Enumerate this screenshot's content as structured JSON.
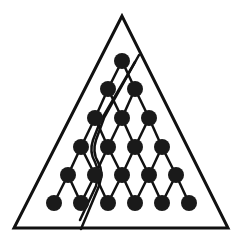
{
  "diagram": {
    "type": "triangular-lattice-partition",
    "colors": {
      "stroke": "#111111",
      "node": "#1a1a1a",
      "background": "#ffffff"
    },
    "outer_triangle": {
      "apex": [
        122,
        16
      ],
      "left": [
        14,
        228
      ],
      "right": [
        228,
        228
      ],
      "stroke_width": 3
    },
    "nodes": [
      [
        122,
        61
      ],
      [
        108,
        89
      ],
      [
        135,
        89
      ],
      [
        95,
        118
      ],
      [
        122,
        118
      ],
      [
        149,
        118
      ],
      [
        81,
        147
      ],
      [
        108,
        147
      ],
      [
        135,
        147
      ],
      [
        162,
        147
      ],
      [
        68,
        175
      ],
      [
        95,
        175
      ],
      [
        122,
        175
      ],
      [
        149,
        175
      ],
      [
        176,
        175
      ],
      [
        54,
        203
      ],
      [
        81,
        203
      ],
      [
        108,
        203
      ],
      [
        135,
        203
      ],
      [
        162,
        203
      ],
      [
        189,
        203
      ]
    ],
    "node_radius": 8,
    "rows": 6,
    "divider": {
      "outer_path": "M139 55 L104 118 L96 140 Q92 152 98 162 Q104 172 99 186 L81 229",
      "inner_path": "M135 62 L100 122 L93 140 Q89 152 95 162 Q100 172 96 186 L80 220",
      "stroke_width": 2.5
    }
  }
}
